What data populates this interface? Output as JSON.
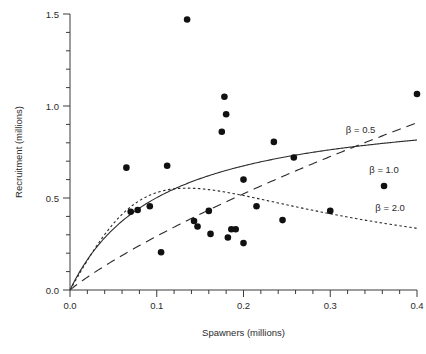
{
  "chart_data": {
    "type": "scatter",
    "title": "",
    "xlabel": "Spawners (millions)",
    "ylabel": "Recruitment (millions)",
    "xlim": [
      0.0,
      0.4
    ],
    "ylim": [
      0.0,
      1.5
    ],
    "grid": false,
    "legend_position": "inline-right",
    "x_ticks": [
      "0.0",
      "0.1",
      "0.2",
      "0.3",
      "0.4"
    ],
    "x_tick_values": [
      0.0,
      0.1,
      0.2,
      0.3,
      0.4
    ],
    "x_minor_step": 0.02,
    "y_ticks": [
      "0.0",
      "0.5",
      "1.0",
      "1.5"
    ],
    "y_tick_values": [
      0.0,
      0.5,
      1.0,
      1.5
    ],
    "y_minor_step": 0.1,
    "points": [
      [
        0.065,
        0.665
      ],
      [
        0.07,
        0.425
      ],
      [
        0.078,
        0.435
      ],
      [
        0.092,
        0.455
      ],
      [
        0.105,
        0.205
      ],
      [
        0.112,
        0.675
      ],
      [
        0.135,
        1.47
      ],
      [
        0.143,
        0.375
      ],
      [
        0.147,
        0.345
      ],
      [
        0.16,
        0.43
      ],
      [
        0.162,
        0.305
      ],
      [
        0.175,
        0.86
      ],
      [
        0.178,
        1.05
      ],
      [
        0.18,
        0.955
      ],
      [
        0.182,
        0.285
      ],
      [
        0.186,
        0.33
      ],
      [
        0.191,
        0.33
      ],
      [
        0.2,
        0.6
      ],
      [
        0.2,
        0.255
      ],
      [
        0.215,
        0.455
      ],
      [
        0.235,
        0.805
      ],
      [
        0.245,
        0.38
      ],
      [
        0.258,
        0.72
      ],
      [
        0.3,
        0.43
      ],
      [
        0.362,
        0.565
      ],
      [
        0.4,
        1.065
      ]
    ],
    "series": [
      {
        "name": "beta = 0.5",
        "label": "β = 0.5",
        "style": "dashed",
        "alpha": 4.1,
        "beta_exponent": 0.5,
        "k": 0.62
      },
      {
        "name": "beta = 1.0",
        "label": "β = 1.0",
        "style": "solid",
        "alpha": 9.8,
        "beta_exponent": 1.0,
        "k": 0.105
      },
      {
        "name": "beta = 2.0",
        "label": "β = 2.0",
        "style": "dotted",
        "alpha": 8.2,
        "beta_exponent": 2.0,
        "k": 0.135
      }
    ],
    "annotations": [
      {
        "text": "β = 0.5",
        "x": 0.318,
        "y": 0.855
      },
      {
        "text": "β = 1.0",
        "x": 0.345,
        "y": 0.638
      },
      {
        "text": "β = 2.0",
        "x": 0.352,
        "y": 0.432
      }
    ]
  }
}
